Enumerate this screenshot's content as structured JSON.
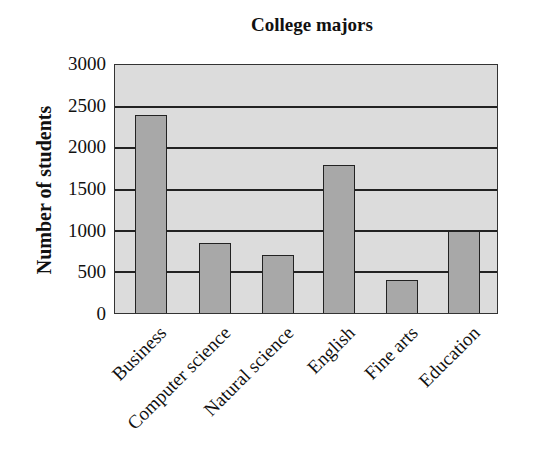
{
  "chart_data": {
    "type": "bar",
    "title": "College majors",
    "xlabel": "",
    "ylabel": "Number of students",
    "ylim": [
      0,
      3000
    ],
    "yticks": [
      0,
      500,
      1000,
      1500,
      2000,
      2500,
      3000
    ],
    "grid": true,
    "categories": [
      "Business",
      "Computer science",
      "Natural science",
      "English",
      "Fine arts",
      "Education"
    ],
    "values": [
      2400,
      850,
      700,
      1800,
      400,
      1000
    ]
  },
  "colors": {
    "plot_background": "#dcdcdc",
    "bar_fill": "#a8a8a8",
    "lines": "#222222"
  }
}
